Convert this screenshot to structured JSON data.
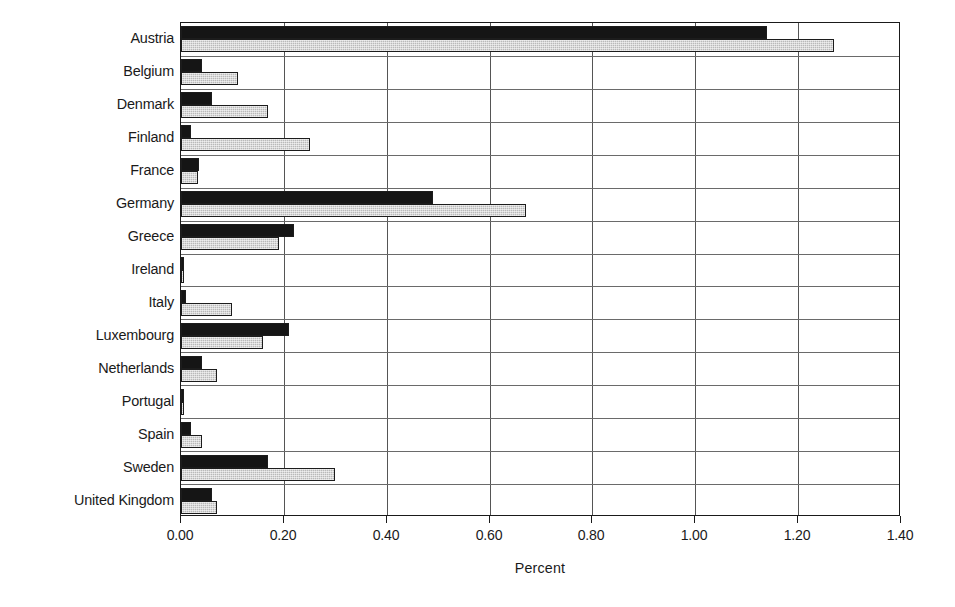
{
  "chart_data": {
    "type": "bar",
    "orientation": "horizontal",
    "title": "",
    "xlabel": "Percent",
    "ylabel": "",
    "xlim": [
      0.0,
      1.4
    ],
    "xticks": [
      "0.00",
      "0.20",
      "0.40",
      "0.60",
      "0.80",
      "1.00",
      "1.20",
      "1.40"
    ],
    "xtick_values": [
      0.0,
      0.2,
      0.4,
      0.6,
      0.8,
      1.0,
      1.2,
      1.4
    ],
    "grid": "vertical",
    "legend": "none",
    "categories": [
      "Austria",
      "Belgium",
      "Denmark",
      "Finland",
      "France",
      "Germany",
      "Greece",
      "Ireland",
      "Italy",
      "Luxembourg",
      "Netherlands",
      "Portugal",
      "Spain",
      "Sweden",
      "United Kingdom"
    ],
    "series": [
      {
        "name": "series-1",
        "style": "dark",
        "color": "#151515",
        "values": [
          1.14,
          0.04,
          0.06,
          0.02,
          0.035,
          0.49,
          0.22,
          0.005,
          0.01,
          0.21,
          0.04,
          0.005,
          0.02,
          0.17,
          0.06
        ]
      },
      {
        "name": "series-2",
        "style": "light-hatched",
        "color": "#b9b9b9",
        "values": [
          1.27,
          0.11,
          0.17,
          0.25,
          0.033,
          0.67,
          0.19,
          0.005,
          0.1,
          0.16,
          0.07,
          0.005,
          0.04,
          0.3,
          0.07
        ]
      }
    ]
  }
}
